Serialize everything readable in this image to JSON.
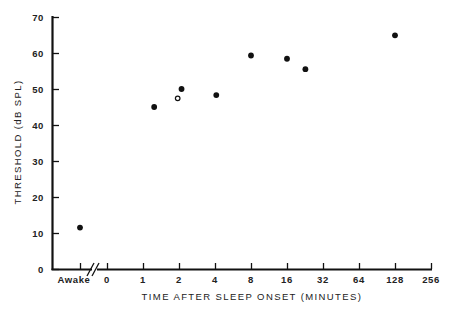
{
  "chart_data": {
    "type": "scatter",
    "title": "",
    "xlabel": "TIME AFTER SLEEP ONSET (MINUTES)",
    "ylabel": "THRESHOLD (dB SPL)",
    "x_scale": "log2 (with separate 'Awake' category and axis break)",
    "ylim": [
      0,
      70
    ],
    "y_ticks": [
      0,
      10,
      20,
      30,
      40,
      50,
      60,
      70
    ],
    "x_tick_labels": [
      "Awake",
      "0",
      "1",
      "2",
      "4",
      "8",
      "16",
      "32",
      "64",
      "128",
      "256"
    ],
    "grid": false,
    "legend": null,
    "series": [
      {
        "name": "filled",
        "marker": "filled-circle",
        "points": [
          {
            "x": "Awake",
            "y": 11.5
          },
          {
            "x": 1.24,
            "y": 45
          },
          {
            "x": 2.1,
            "y": 50
          },
          {
            "x": 4.1,
            "y": 48.3
          },
          {
            "x": 8,
            "y": 59.3
          },
          {
            "x": 16,
            "y": 58.4
          },
          {
            "x": 22.8,
            "y": 55.5
          },
          {
            "x": 128,
            "y": 64.9
          }
        ]
      },
      {
        "name": "open",
        "marker": "open-circle",
        "points": [
          {
            "x": 1.95,
            "y": 47.4
          }
        ]
      }
    ]
  },
  "axes": {
    "y_title": "THRESHOLD (dB SPL)",
    "x_title": "TIME AFTER SLEEP ONSET (MINUTES)"
  }
}
